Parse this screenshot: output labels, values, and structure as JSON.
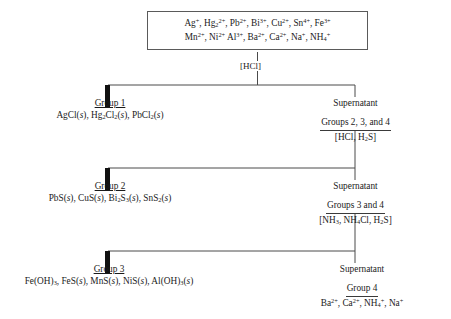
{
  "diagram": {
    "line_color": "#4a4a4a",
    "bar_color": "#111111",
    "box_border_color": "#5a5a5a"
  },
  "sample": {
    "name": "unknown-sample-box",
    "line1": "Ag+, Hg22+, Pb2+, Bi3+, Cu2+, Sn4+, Fe3+",
    "line2": "Mn2+, Ni2+ Al3+, Ba2+, Ca2+, Na+, NH4+",
    "line1_ions": [
      {
        "formula": "Ag",
        "charge": "+"
      },
      {
        "formula": "Hg",
        "sub": "2",
        "charge": "2+"
      },
      {
        "formula": "Pb",
        "charge": "2+"
      },
      {
        "formula": "Bi",
        "charge": "3+"
      },
      {
        "formula": "Cu",
        "charge": "2+"
      },
      {
        "formula": "Sn",
        "charge": "4+"
      },
      {
        "formula": "Fe",
        "charge": "3+"
      }
    ],
    "line2_ions": [
      {
        "formula": "Mn",
        "charge": "2+"
      },
      {
        "formula": "Ni",
        "charge": "2+"
      },
      {
        "formula": "Al",
        "charge": "3+"
      },
      {
        "formula": "Ba",
        "charge": "2+"
      },
      {
        "formula": "Ca",
        "charge": "2+"
      },
      {
        "formula": "Na",
        "charge": "+"
      },
      {
        "formula": "NH",
        "sub": "4",
        "charge": "+"
      }
    ]
  },
  "reagents": {
    "step1": "[HCl]",
    "step2": "[HCl, H2S]",
    "step3": "[NH3, NH4Cl, H2S]"
  },
  "group1": {
    "title": "Group 1",
    "formulas": "AgCl(s), Hg2Cl2(s), PbCl2(s)"
  },
  "group2": {
    "title": "Group 2",
    "formulas": "PbS(s), CuS(s), Bi2S3(s), SnS2(s)"
  },
  "group3": {
    "title": "Group 3",
    "formulas": "Fe(OH)3, FeS(s), MnS(s), NiS(s), Al(OH)3(s)"
  },
  "supernatant1": {
    "head": "Supernatant",
    "groups": "Groups 2, 3, and 4",
    "reagent": "[HCl, H2S]"
  },
  "supernatant2": {
    "head": "Supernatant",
    "groups": "Groups 3 and 4",
    "reagent": "[NH3, NH4Cl, H2S]"
  },
  "supernatant3": {
    "head": "Supernatant",
    "groups": "Group 4",
    "ions": "Ba2+, Ca2+, NH4+, Na+"
  }
}
